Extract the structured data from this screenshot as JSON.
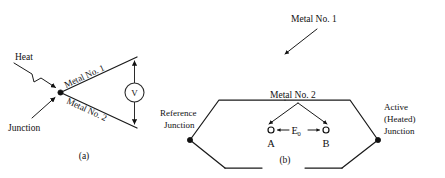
{
  "figure": {
    "background_color": "#ffffff",
    "ink_color": "#111111",
    "panels": [
      {
        "id": "a",
        "caption": "(a)",
        "labels": {
          "heat": "Heat",
          "junction": "Junction",
          "metal_1": "Metal No. 1",
          "metal_2": "Metal No. 2",
          "voltmeter": "V"
        }
      },
      {
        "id": "b",
        "caption": "(b)",
        "labels": {
          "metal_1": "Metal No. 1",
          "metal_2": "Metal No. 2",
          "reference_junction_line1": "Reference",
          "reference_junction_line2": "Junction",
          "active_junction_line1": "Active",
          "active_junction_line2": "(Heated)",
          "active_junction_line3": "Junction",
          "point_a": "A",
          "point_b": "B",
          "emf_symbol": "E",
          "emf_subscript": "0"
        }
      }
    ]
  }
}
